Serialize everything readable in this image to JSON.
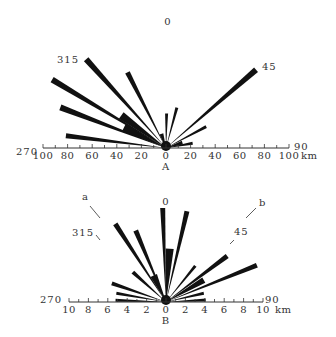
{
  "chart_data": [
    {
      "type": "rose",
      "panel": "A",
      "title": "A",
      "origin_px": [
        166,
        148
      ],
      "px_per_unit": 1.23,
      "unit": "km",
      "bearing_labels": [
        {
          "text": "0",
          "angle": 0
        },
        {
          "text": "315",
          "angle": 315
        },
        {
          "text": "45",
          "angle": 45
        },
        {
          "text": "270",
          "angle": 270
        },
        {
          "text": "90",
          "angle": 90
        }
      ],
      "axis_ticks_left": [
        "100",
        "80",
        "60",
        "40",
        "20"
      ],
      "axis_ticks_right": [
        "0",
        "20",
        "40",
        "60",
        "80",
        "100"
      ],
      "axis_unit_label": "km",
      "axis_range": [
        -100,
        100
      ],
      "petals": [
        {
          "bearing": 318,
          "length": 97,
          "width": 6
        },
        {
          "bearing": 301,
          "length": 108,
          "width": 6
        },
        {
          "bearing": 291,
          "length": 92,
          "width": 6
        },
        {
          "bearing": 277,
          "length": 82,
          "width": 5
        },
        {
          "bearing": 333,
          "length": 69,
          "width": 5
        },
        {
          "bearing": 306,
          "length": 45,
          "width": 8
        },
        {
          "bearing": 296,
          "length": 38,
          "width": 8
        },
        {
          "bearing": 1,
          "length": 28,
          "width": 3
        },
        {
          "bearing": 15,
          "length": 34,
          "width": 3
        },
        {
          "bearing": 49,
          "length": 97,
          "width": 6
        },
        {
          "bearing": 62,
          "length": 37,
          "width": 3
        },
        {
          "bearing": 80,
          "length": 22,
          "width": 3
        },
        {
          "bearing": 72,
          "length": 14,
          "width": 4
        },
        {
          "bearing": 342,
          "length": 12,
          "width": 4
        }
      ]
    },
    {
      "type": "rose",
      "panel": "B",
      "title": "B",
      "origin_px": [
        166,
        302
      ],
      "px_per_unit": 9.7,
      "unit": "km",
      "bearing_labels": [
        {
          "text": "0",
          "angle": 0
        },
        {
          "text": "315",
          "angle": 315
        },
        {
          "text": "45",
          "angle": 45
        },
        {
          "text": "270",
          "angle": 270
        },
        {
          "text": "90",
          "angle": 90
        }
      ],
      "direction_markers": [
        {
          "text": "a",
          "angle": 325
        },
        {
          "text": "b",
          "angle": 40
        }
      ],
      "axis_ticks_left": [
        "10",
        "8",
        "6",
        "4",
        "2"
      ],
      "axis_ticks_right": [
        "0",
        "2",
        "4",
        "6",
        "8",
        "10"
      ],
      "axis_unit_label": "km",
      "axis_range": [
        -10,
        10
      ],
      "petals": [
        {
          "bearing": 358,
          "length": 9.7,
          "width": 5
        },
        {
          "bearing": 13,
          "length": 9.6,
          "width": 5
        },
        {
          "bearing": 4,
          "length": 5.5,
          "width": 8
        },
        {
          "bearing": 327,
          "length": 9.6,
          "width": 5
        },
        {
          "bearing": 337,
          "length": 8.0,
          "width": 5
        },
        {
          "bearing": 335,
          "length": 3.0,
          "width": 7
        },
        {
          "bearing": 312,
          "length": 4.6,
          "width": 4
        },
        {
          "bearing": 289,
          "length": 5.9,
          "width": 4
        },
        {
          "bearing": 280,
          "length": 5.2,
          "width": 3
        },
        {
          "bearing": 272,
          "length": 5.2,
          "width": 3
        },
        {
          "bearing": 39,
          "length": 4.8,
          "width": 3
        },
        {
          "bearing": 53,
          "length": 7.9,
          "width": 5
        },
        {
          "bearing": 68,
          "length": 10.1,
          "width": 5
        },
        {
          "bearing": 77,
          "length": 4.0,
          "width": 3
        },
        {
          "bearing": 87,
          "length": 4.1,
          "width": 3
        },
        {
          "bearing": 60,
          "length": 4.5,
          "width": 6
        }
      ]
    }
  ]
}
